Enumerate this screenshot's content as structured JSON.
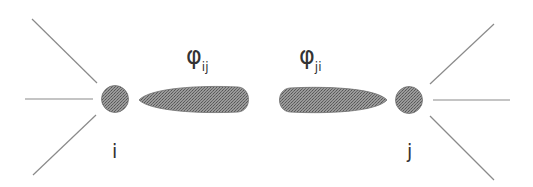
{
  "diagram": {
    "nodes": [
      {
        "id": "i",
        "label": "i"
      },
      {
        "id": "j",
        "label": "j"
      }
    ],
    "lobes": [
      {
        "symbol": "φ",
        "subscript": "ij",
        "from": "i",
        "toward": "j"
      },
      {
        "symbol": "φ",
        "subscript": "ji",
        "from": "j",
        "toward": "i"
      }
    ],
    "colors": {
      "line": "#8a8a8a",
      "node_fill": "#8c8c8c",
      "lobe_fill": "#7e7e7e",
      "text": "#333333"
    }
  }
}
